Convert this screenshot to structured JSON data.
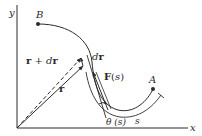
{
  "diagram": {
    "type": "physics-vector-diagram",
    "axes": {
      "x_label": "x",
      "y_label": "y"
    },
    "points": {
      "start": {
        "label": "B"
      },
      "end": {
        "label": "A"
      }
    },
    "vectors": {
      "position": {
        "label": "r"
      },
      "position_plus": {
        "label": "r + dr"
      },
      "displacement": {
        "label": "dr"
      },
      "force": {
        "label": "F(s)"
      }
    },
    "angle": {
      "label": "θ (s)"
    },
    "arc_length": {
      "label": "s"
    },
    "colors": {
      "ink": "#2a2a2a",
      "background": "#ffffff"
    }
  }
}
